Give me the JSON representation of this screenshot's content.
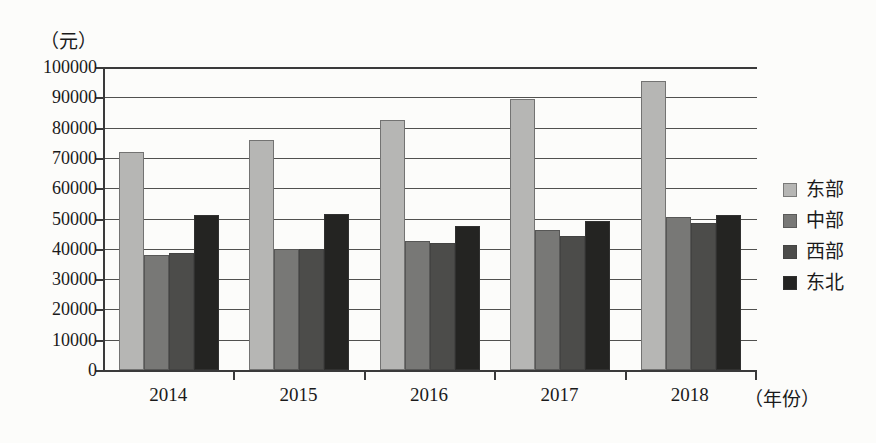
{
  "chart_data": {
    "type": "bar",
    "title": "",
    "subtitle": "",
    "unit_label": "（元）",
    "xlabel": "（年份）",
    "ylabel": "",
    "ylim": [
      0,
      100000
    ],
    "ytick_step": 10000,
    "grid": true,
    "legend_position": "right",
    "categories": [
      "2014",
      "2015",
      "2016",
      "2017",
      "2018"
    ],
    "ytick_labels": [
      "100000",
      "90000",
      "80000",
      "70000",
      "60000",
      "50000",
      "40000",
      "30000",
      "20000",
      "10000",
      "0"
    ],
    "ytick_values": [
      100000,
      90000,
      80000,
      70000,
      60000,
      50000,
      40000,
      30000,
      20000,
      10000,
      0
    ],
    "series": [
      {
        "name": "东部",
        "color": "#b6b6b4",
        "values": [
          72000,
          76000,
          82500,
          89500,
          95500
        ]
      },
      {
        "name": "中部",
        "color": "#787876",
        "values": [
          38000,
          39800,
          42700,
          46300,
          50500
        ]
      },
      {
        "name": "西部",
        "color": "#4c4c4a",
        "values": [
          38500,
          39800,
          42000,
          44300,
          48500
        ]
      },
      {
        "name": "东北",
        "color": "#242422",
        "values": [
          51000,
          51500,
          47500,
          49300,
          51000
        ]
      }
    ]
  },
  "legend": {
    "items": [
      {
        "label": "东部"
      },
      {
        "label": "中部"
      },
      {
        "label": "西部"
      },
      {
        "label": "东北"
      }
    ]
  },
  "axes": {
    "unit": "（元）",
    "x_title": "（年份）"
  }
}
